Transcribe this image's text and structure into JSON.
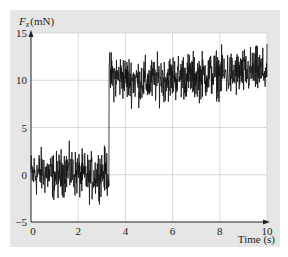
{
  "chart_data": {
    "type": "line",
    "title": "",
    "ylabel": "F_x (mN)",
    "ylabel_main": "F",
    "ylabel_sub": "x",
    "ylabel_unit": "(mN)",
    "xlabel": "Time (s)",
    "xlim": [
      0,
      10
    ],
    "ylim": [
      -5,
      15
    ],
    "xticks": [
      0,
      2,
      4,
      6,
      8,
      10
    ],
    "yticks": [
      -5,
      0,
      5,
      10,
      15
    ],
    "xtick_labels": [
      "0",
      "2",
      "4",
      "6",
      "8",
      "10"
    ],
    "ytick_labels": [
      "−5",
      "0",
      "5",
      "10",
      "15"
    ],
    "grid": true,
    "legend": null,
    "series": [
      {
        "name": "F_x",
        "description": "Noisy step signal: mean ~0 mN before t≈3.3 s, mean ~10.5 mN after; noise amplitude about ±2 mN",
        "step_time": 3.3,
        "level_before": 0.0,
        "level_after": 10.5,
        "noise_amplitude": 2.0,
        "x": [
          0,
          0.5,
          1.0,
          1.5,
          2.0,
          2.5,
          3.0,
          3.3,
          3.31,
          4.0,
          4.5,
          5.0,
          5.5,
          6.0,
          6.5,
          7.0,
          7.5,
          8.0,
          8.5,
          9.0,
          9.5,
          10.0
        ],
        "values": [
          0,
          0.3,
          -0.2,
          0.5,
          0,
          -0.3,
          0.4,
          0.2,
          10.5,
          10.2,
          10.0,
          9.8,
          10.2,
          10.3,
          10.5,
          10.4,
          10.6,
          10.7,
          10.6,
          10.8,
          11.0,
          10.8
        ]
      }
    ],
    "colors": {
      "line": "#111111",
      "grid": "#cfcfcf",
      "axis": "#222222",
      "panel": "#e6e6e6",
      "plot_bg": "#ffffff"
    }
  }
}
